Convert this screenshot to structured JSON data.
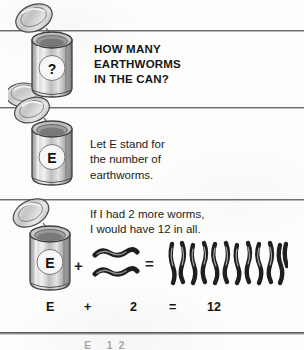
{
  "page": {
    "kind": "scanned-worksheet-page",
    "background_color": "#fdfdfb",
    "rule_color": "#6e6e6e",
    "ink_color": "#1a1a1a"
  },
  "rows": {
    "heading_row": {
      "heading_text": "HOW MANY\nEARTHWORMS\nIN THE CAN?",
      "can_label": "?"
    },
    "definition_row": {
      "body_text": "Let E stand for\nthe number of\nearthworms.",
      "can_label": "E"
    },
    "story_row": {
      "body_text": "If I had 2 more worms,\nI would have 12 in all.",
      "can_label": "E"
    }
  },
  "visual_equation": {
    "can_label": "E",
    "plus_symbol": "+",
    "equals_symbol": "=",
    "added_worms_count": 2,
    "total_worms_count": 12
  },
  "symbolic_equation": {
    "variable": "E",
    "plus": "+",
    "addend": "2",
    "equals": "=",
    "total": "12"
  },
  "cut_off_text": "E   12"
}
